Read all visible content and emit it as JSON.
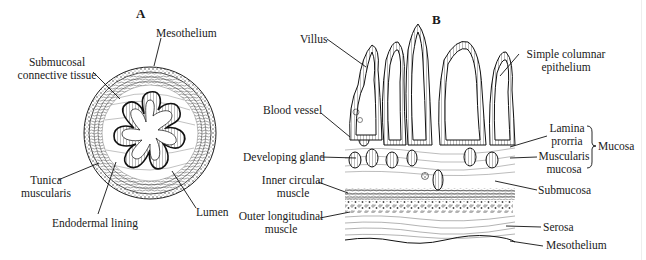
{
  "figure": {
    "panels": {
      "A": {
        "letter": "A",
        "title": "Cross-section of gut tube",
        "labels": {
          "mesothelium": "Mesothelium",
          "submucosal_1": "Submucosal",
          "submucosal_2": "connective tissue",
          "tunica_1": "Tunica",
          "tunica_2": "muscularis",
          "lumen": "Lumen",
          "endodermal": "Endodermal lining"
        }
      },
      "B": {
        "letter": "B",
        "labels": {
          "villus": "Villus",
          "simple_1": "Simple columnar",
          "simple_2": "epithelium",
          "blood_vessel": "Blood vessel",
          "lamina_1": "Lamina",
          "lamina_2": "prorria",
          "muscularis_1": "Muscularis",
          "muscularis_2": "mucosa",
          "mucosa": "Mucosa",
          "developing_gland": "Developing gland",
          "inner_1": "Inner circular",
          "inner_2": "muscle",
          "submucosa": "Submucosa",
          "outer_1": "Outer longitudinal",
          "outer_2": "muscle",
          "serosa": "Serosa",
          "mesothelium": "Mesothelium"
        }
      }
    },
    "colors": {
      "ink": "#1a1a1a",
      "background": "#ffffff"
    }
  }
}
